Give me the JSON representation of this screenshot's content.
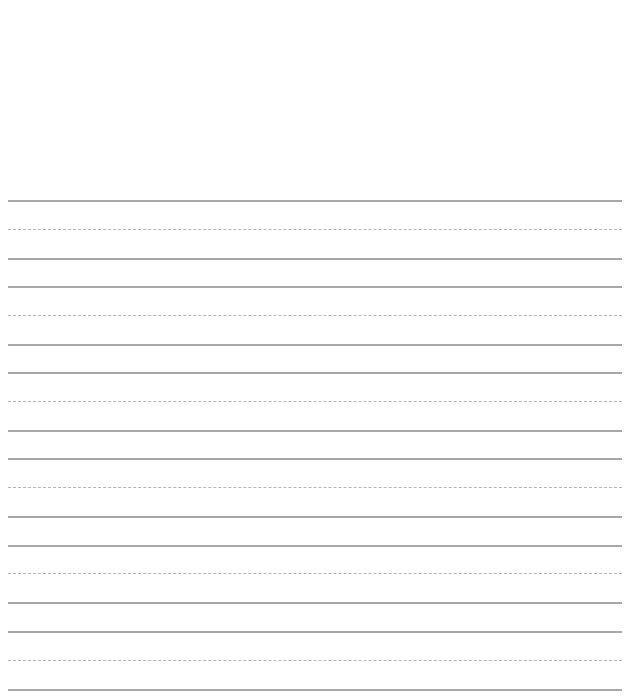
{
  "sheet": {
    "type": "handwriting-practice-lines",
    "line_color_solid": "#a8a8a8",
    "line_color_dashed": "#b4b4b4",
    "groups": [
      {
        "top": 200,
        "mid": 229,
        "bottom": 258
      },
      {
        "top": 286,
        "mid": 315,
        "bottom": 344
      },
      {
        "top": 372,
        "mid": 401,
        "bottom": 430
      },
      {
        "top": 458,
        "mid": 487,
        "bottom": 516
      },
      {
        "top": 545,
        "mid": 573,
        "bottom": 602
      },
      {
        "top": 631,
        "mid": 660,
        "bottom": 689
      }
    ]
  }
}
